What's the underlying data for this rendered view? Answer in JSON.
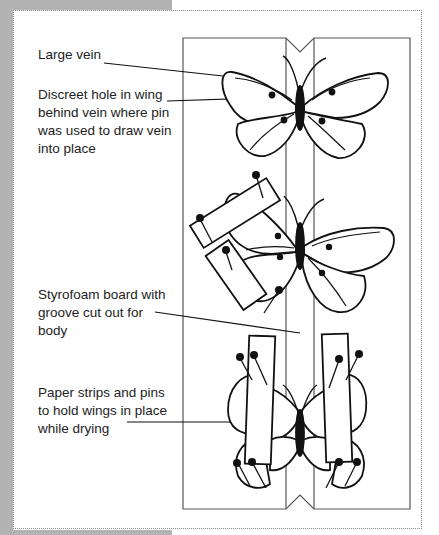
{
  "diagram": {
    "labels": [
      {
        "id": "large-vein",
        "text": "Large vein",
        "top": 55
      },
      {
        "id": "discreet-hole",
        "text": "Discreet hole in wing behind vein where pin was used to draw vein into place",
        "top": 94
      },
      {
        "id": "styrofoam-board",
        "text": "Styrofoam board with groove cut out for body",
        "top": 281
      },
      {
        "id": "paper-strips",
        "text": "Paper strips and pins to hold wings in place while drying",
        "top": 379
      }
    ],
    "colors": {
      "background": "#ffffff",
      "shadow": "#b3b3b3",
      "frame_border": "#8a8a8a",
      "line": "#111111",
      "board_line": "#555555",
      "text": "#222222"
    }
  }
}
